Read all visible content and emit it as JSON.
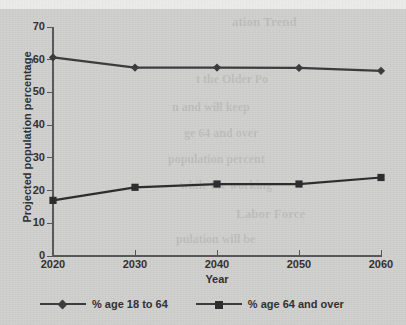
{
  "chart_data": {
    "type": "line",
    "title": "",
    "xlabel": "Year",
    "ylabel": "Projected population percentage",
    "categories": [
      "2020",
      "2030",
      "2040",
      "2050",
      "2060"
    ],
    "x": [
      2020,
      2030,
      2040,
      2050,
      2060
    ],
    "xlim": [
      2020,
      2060
    ],
    "ylim": [
      0,
      70
    ],
    "yticks": [
      "0",
      "10",
      "20",
      "30",
      "40",
      "50",
      "60",
      "70"
    ],
    "ytick_values": [
      0,
      10,
      20,
      30,
      40,
      50,
      60,
      70
    ],
    "grid": false,
    "legend_position": "bottom",
    "series": [
      {
        "name": "% age 18 to 64",
        "marker": "diamond",
        "color": "#3a3a3d",
        "values": [
          60.7,
          57.6,
          57.6,
          57.5,
          56.6
        ]
      },
      {
        "name": "% age 64 and over",
        "marker": "square",
        "color": "#2b2b2d",
        "values": [
          17.0,
          21.0,
          22.0,
          22.0,
          24.0
        ]
      }
    ]
  },
  "legend": {
    "entries": [
      {
        "label": "% age 18 to 64"
      },
      {
        "label": "% age 64 and over"
      }
    ]
  },
  "background": {
    "page_color": "#cfcfcd",
    "strip_color": "#ececeb",
    "axis_color": "#55555a",
    "text_color": "#2e2e30"
  },
  "bleed_through": [
    {
      "text": "ation Trend"
    },
    {
      "text": "t the Older Po"
    },
    {
      "text": "n and will keep"
    },
    {
      "text": "ge 64 and over"
    },
    {
      "text": "population percent"
    },
    {
      "text": "while the working"
    },
    {
      "text": "Labor Force"
    },
    {
      "text": "pulation will be"
    }
  ]
}
